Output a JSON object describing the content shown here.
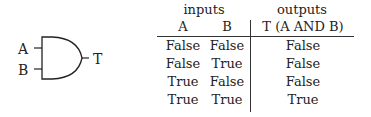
{
  "gate": {
    "type": "AND",
    "inputs": [
      "A",
      "B"
    ],
    "output": "T"
  },
  "table": {
    "groups": {
      "inputs": "inputs",
      "outputs": "outputs"
    },
    "headers": [
      "A",
      "B",
      "T (A AND B)"
    ],
    "rows": [
      [
        "False",
        "False",
        "False"
      ],
      [
        "False",
        "True",
        "False"
      ],
      [
        "True",
        "False",
        "False"
      ],
      [
        "True",
        "True",
        "True"
      ]
    ]
  }
}
